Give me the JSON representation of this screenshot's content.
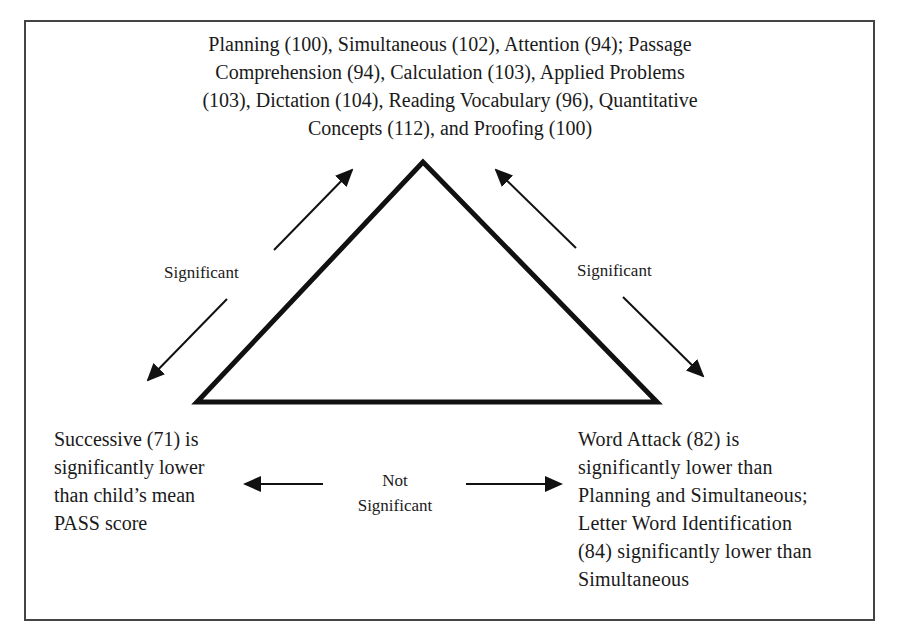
{
  "diagram": {
    "type": "triangle-relationship",
    "top_node": {
      "lines": [
        "Planning (100), Simultaneous (102), Attention (94); Passage",
        "Comprehension (94), Calculation (103), Applied Problems",
        "(103), Dictation (104), Reading Vocabulary (96), Quantitative",
        "Concepts (112), and Proofing (100)"
      ],
      "scores": [
        {
          "name": "Planning",
          "score": 100
        },
        {
          "name": "Simultaneous",
          "score": 102
        },
        {
          "name": "Attention",
          "score": 94
        },
        {
          "name": "Passage Comprehension",
          "score": 94
        },
        {
          "name": "Calculation",
          "score": 103
        },
        {
          "name": "Applied Problems",
          "score": 103
        },
        {
          "name": "Dictation",
          "score": 104
        },
        {
          "name": "Reading Vocabulary",
          "score": 96
        },
        {
          "name": "Quantitative Concepts",
          "score": 112
        },
        {
          "name": "Proofing",
          "score": 100
        }
      ]
    },
    "left_node": {
      "lines": [
        "Successive (71) is",
        "significantly lower",
        "than child’s mean",
        "PASS score"
      ]
    },
    "right_node": {
      "lines": [
        "Word Attack (82) is",
        "significantly lower than",
        "Planning and Simultaneous;",
        "Letter Word Identification",
        "(84) significantly lower than",
        "Simultaneous"
      ]
    },
    "edges": {
      "left": {
        "label": "Significant"
      },
      "right": {
        "label": "Significant"
      },
      "bottom": {
        "label_line1": "Not",
        "label_line2": "Significant"
      }
    },
    "colors": {
      "stroke": "#111111",
      "frame": "#444444",
      "background": "#ffffff"
    }
  }
}
